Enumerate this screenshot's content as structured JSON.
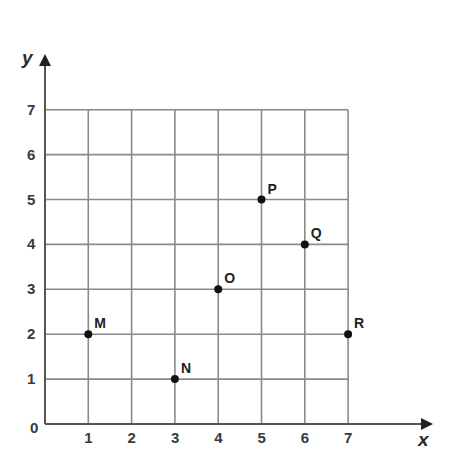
{
  "chart_data": {
    "type": "scatter",
    "title": "",
    "xlabel": "x",
    "ylabel": "y",
    "xlim": [
      0,
      7
    ],
    "ylim": [
      0,
      7
    ],
    "grid": true,
    "origin_label": "0",
    "x_ticks": [
      "1",
      "2",
      "3",
      "4",
      "5",
      "6",
      "7"
    ],
    "y_ticks": [
      "1",
      "2",
      "3",
      "4",
      "5",
      "6",
      "7"
    ],
    "points": [
      {
        "label": "M",
        "x": 1,
        "y": 2
      },
      {
        "label": "N",
        "x": 3,
        "y": 1
      },
      {
        "label": "O",
        "x": 4,
        "y": 3
      },
      {
        "label": "P",
        "x": 5,
        "y": 5
      },
      {
        "label": "Q",
        "x": 6,
        "y": 4
      },
      {
        "label": "R",
        "x": 7,
        "y": 2
      }
    ]
  },
  "colors": {
    "grid": "#8a8a8a",
    "axis": "#555555",
    "point": "#111111",
    "text": "#333333"
  }
}
